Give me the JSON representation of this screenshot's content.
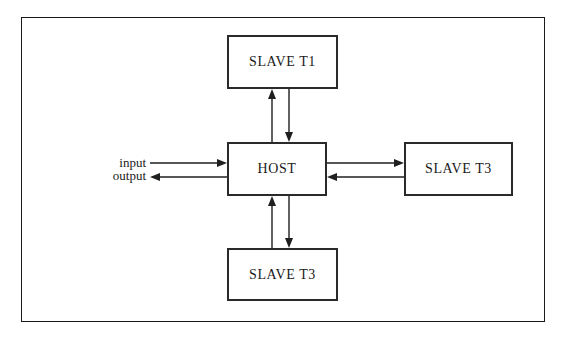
{
  "diagram": {
    "frame": {
      "name": "outer-border"
    },
    "nodes": [
      {
        "id": "slave-top",
        "label": "SLAVE T1",
        "position": "top"
      },
      {
        "id": "host",
        "label": "HOST",
        "position": "center"
      },
      {
        "id": "slave-right",
        "label": "SLAVE T3",
        "position": "right"
      },
      {
        "id": "slave-bottom",
        "label": "SLAVE T3",
        "position": "bottom"
      }
    ],
    "io_labels": [
      {
        "id": "input",
        "label": "input",
        "direction": "into-host"
      },
      {
        "id": "output",
        "label": "output",
        "direction": "out-of-host"
      }
    ],
    "connections": [
      {
        "from": "host",
        "to": "slave-top",
        "direction": "up"
      },
      {
        "from": "slave-top",
        "to": "host",
        "direction": "down"
      },
      {
        "from": "host",
        "to": "slave-right",
        "direction": "right"
      },
      {
        "from": "slave-right",
        "to": "host",
        "direction": "left"
      },
      {
        "from": "slave-bottom",
        "to": "host",
        "direction": "up"
      },
      {
        "from": "host",
        "to": "slave-bottom",
        "direction": "down"
      }
    ],
    "colors": {
      "background": "#ffffff",
      "line": "#1f1f1f",
      "box_border": "#2a2a2a",
      "text": "#1a1a1a"
    }
  }
}
